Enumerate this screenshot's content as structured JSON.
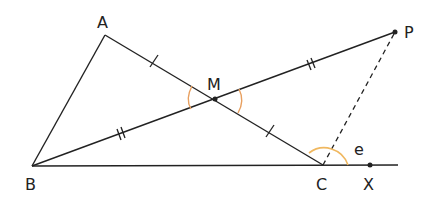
{
  "diagram": {
    "title": "",
    "points": {
      "A": {
        "label": "A",
        "x": 105,
        "y": 35
      },
      "B": {
        "label": "B",
        "x": 32,
        "y": 166
      },
      "M": {
        "label": "M",
        "x": 215,
        "y": 99
      },
      "P": {
        "label": "P",
        "x": 395,
        "y": 32
      },
      "C": {
        "label": "C",
        "x": 323,
        "y": 165
      },
      "X": {
        "label": "X",
        "x": 370,
        "y": 165
      }
    },
    "angle_label": "e",
    "colors": {
      "line": "#222222",
      "angle_arc": "#e8a060",
      "angle_arc_c": "#f0b860"
    }
  }
}
